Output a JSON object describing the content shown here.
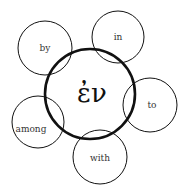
{
  "diagram": {
    "center": {
      "label": "ἐν",
      "cx": 90,
      "cy": 94,
      "r": 45
    },
    "satellites": [
      {
        "label": "by",
        "cx": 45,
        "cy": 48,
        "r": 27
      },
      {
        "label": "in",
        "cx": 118,
        "cy": 37,
        "r": 26
      },
      {
        "label": "to",
        "cx": 150,
        "cy": 105,
        "r": 27
      },
      {
        "label": "with",
        "cx": 100,
        "cy": 157,
        "r": 27
      },
      {
        "label": "among",
        "cx": 38,
        "cy": 122,
        "r": 26
      }
    ],
    "colors": {
      "stroke": "#111111",
      "background": "#ffffff"
    }
  }
}
